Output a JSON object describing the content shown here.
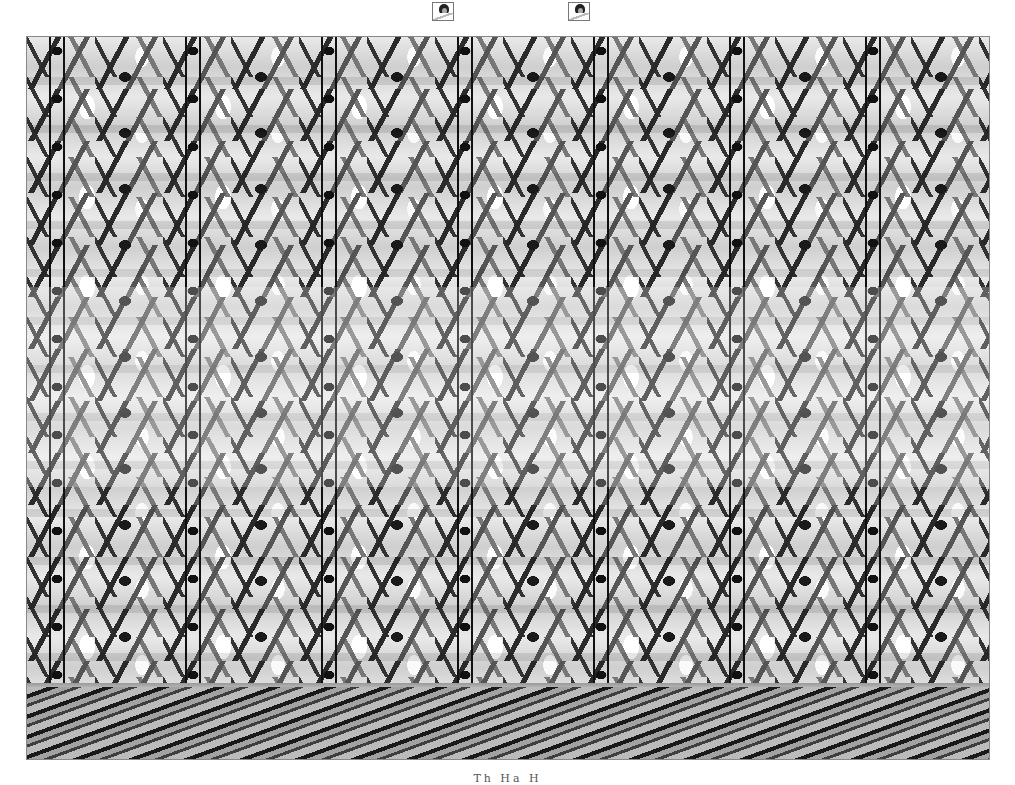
{
  "image": {
    "kind": "autostereogram",
    "subject": "repeating crowd of martial artists in white uniforms with black belts",
    "palette": {
      "dark": "#111111",
      "mid": "#777777",
      "light": "#f4f4f4",
      "border": "#888888"
    },
    "repeat_period_px": 136
  },
  "guide_markers": [
    {
      "name": "left-guide-marker",
      "x": 432,
      "y": 2
    },
    {
      "name": "right-guide-marker",
      "x": 568,
      "y": 2
    }
  ],
  "caption": {
    "text": "Th  Ha  H",
    "note": "partially cut off at bottom edge"
  }
}
